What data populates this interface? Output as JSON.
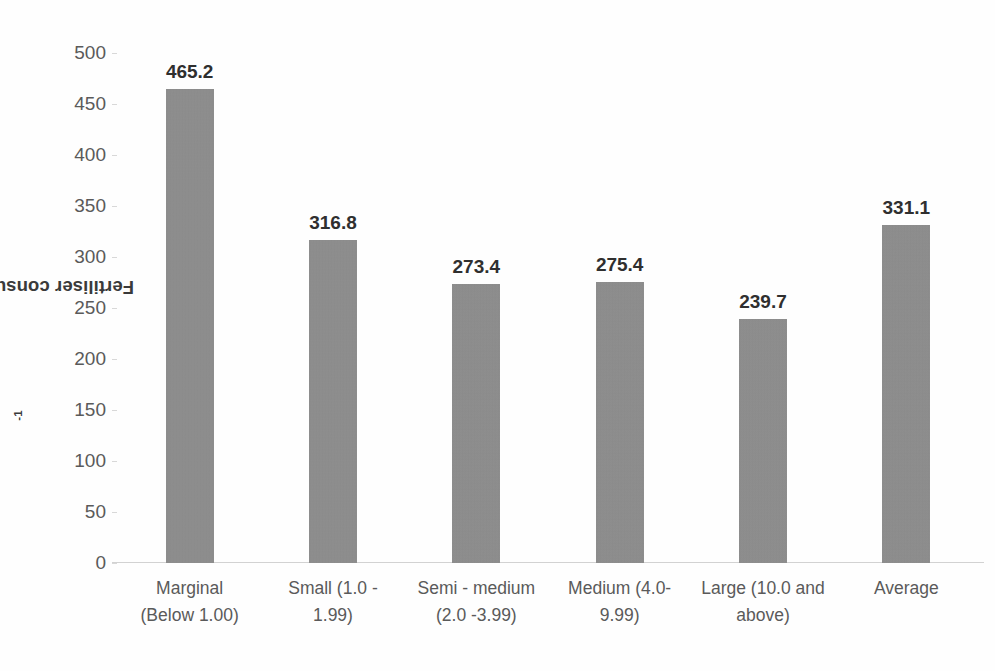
{
  "chart_data": {
    "type": "bar",
    "title": "",
    "xlabel": "",
    "ylabel": "Fertiliser consumption ( kg ha",
    "ylabel_sup": "-1",
    "ylabel_suffix": ")",
    "categories": [
      "Marginal (Below 1.00)",
      "Small (1.0 - 1.99)",
      "Semi - medium (2.0 -3.99)",
      "Medium (4.0-9.99)",
      "Large (10.0 and above)",
      "Average"
    ],
    "category_lines": [
      [
        "Marginal",
        "(Below 1.00)"
      ],
      [
        "Small (1.0 -",
        "1.99)"
      ],
      [
        "Semi - medium",
        "(2.0 -3.99)"
      ],
      [
        "Medium (4.0-",
        "9.99)"
      ],
      [
        "Large (10.0 and",
        "above)"
      ],
      [
        "Average",
        ""
      ]
    ],
    "values": [
      465.2,
      316.8,
      273.4,
      275.4,
      239.7,
      331.1
    ],
    "value_labels": [
      "465.2",
      "316.8",
      "273.4",
      "275.4",
      "239.7",
      "331.1"
    ],
    "ylim": [
      0,
      500
    ],
    "ytick_step": 50,
    "ytick_labels": [
      "500",
      "450",
      "400",
      "350",
      "300",
      "250",
      "200",
      "150",
      "100",
      "50",
      "0"
    ],
    "ytick_values": [
      500,
      450,
      400,
      350,
      300,
      250,
      200,
      150,
      100,
      50,
      0
    ],
    "grid": false,
    "legend": false,
    "legend_position": "none",
    "bar_color": "#8b8b8b",
    "label_color": "#2f2f2f",
    "axis_color": "#d2d2d2",
    "tick_text_color": "#5a5a5a"
  }
}
